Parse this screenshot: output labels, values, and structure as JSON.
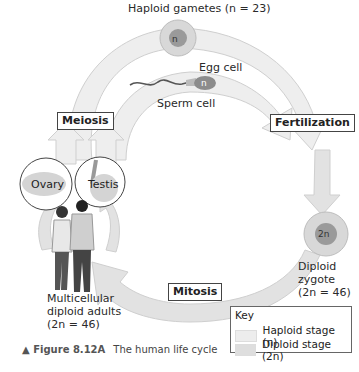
{
  "title": "Haploid gametes (n = 23)",
  "labels": {
    "egg_cell": "Egg cell",
    "sperm_cell": "Sperm cell",
    "egg_nucleus": "n",
    "sperm_nucleus": "n",
    "zygote_nucleus": "2n",
    "zygote": [
      "Diploid",
      "zygote",
      "(2n = 46)"
    ],
    "adults": [
      "Multicellular",
      "diploid adults",
      "(2n = 46)"
    ],
    "ovary": "Ovary",
    "testis": "Testis"
  },
  "processes": {
    "meiosis": "Meiosis",
    "fertilization": "Fertilization",
    "mitosis": "Mitosis"
  },
  "key": {
    "title": "Key",
    "items": [
      {
        "label": "Haploid stage (n)",
        "color": "#ededed"
      },
      {
        "label": "Diploid stage (2n)",
        "color": "#dedede"
      }
    ]
  },
  "caption": {
    "figure": "▲ Figure 8.12A",
    "text": "The human life cycle"
  },
  "colors": {
    "haploid_arrow": "#eeeeee",
    "diploid_arrow": "#e2e2e2",
    "arrow_outline": "#c8c8c8"
  }
}
